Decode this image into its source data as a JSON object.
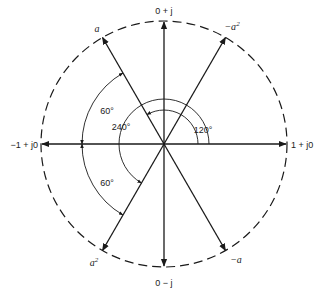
{
  "diagram": {
    "type": "phasor-diagram",
    "center": [
      164,
      144
    ],
    "radius": 123,
    "axis_labels": {
      "top": "0 + j",
      "bottom": "0 − j",
      "left": "−1 + j0",
      "right": "1 + j0"
    },
    "vectors": [
      {
        "name": "a",
        "angle_deg": 120,
        "label": "a",
        "sup": ""
      },
      {
        "name": "minus-a-squared",
        "angle_deg": 60,
        "label": "−a",
        "sup": "2"
      },
      {
        "name": "a-squared",
        "angle_deg": 240,
        "label": "a",
        "sup": "2"
      },
      {
        "name": "minus-a",
        "angle_deg": 300,
        "label": "−a",
        "sup": ""
      }
    ],
    "angle_labels": {
      "a120": "120°",
      "a240": "240°",
      "upper60": "60°",
      "lower60": "60°"
    },
    "colors": {
      "ink": "#1a1a1a",
      "background": "#ffffff"
    }
  }
}
